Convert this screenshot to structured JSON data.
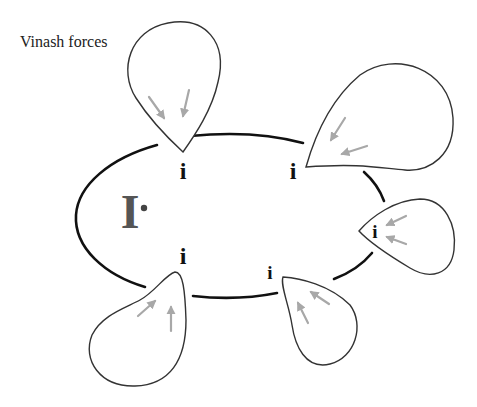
{
  "diagram": {
    "title": "Vinash forces",
    "center_label": "I",
    "node_label": "i",
    "colors": {
      "ring": "#111111",
      "drop_outline": "#333333",
      "arrows": "#a8a8a8",
      "center_label": "#555555"
    },
    "nodes": [
      {
        "position": "top-left",
        "label": "i"
      },
      {
        "position": "top-right",
        "label": "i"
      },
      {
        "position": "right",
        "label": "i"
      },
      {
        "position": "bottom-right",
        "label": "i"
      },
      {
        "position": "bottom-left",
        "label": "i"
      }
    ],
    "force_lobes": [
      {
        "position": "top-left",
        "arrow_count": 2,
        "direction": "inward-down"
      },
      {
        "position": "top-right",
        "arrow_count": 2,
        "direction": "inward-left"
      },
      {
        "position": "right",
        "arrow_count": 2,
        "direction": "inward-left"
      },
      {
        "position": "bottom-right",
        "arrow_count": 2,
        "direction": "inward-up-left"
      },
      {
        "position": "bottom-left",
        "arrow_count": 2,
        "direction": "inward-up"
      }
    ]
  }
}
